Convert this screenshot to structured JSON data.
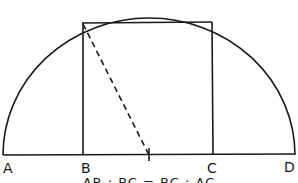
{
  "diagram": {
    "labels": {
      "A": "A",
      "B": "B",
      "C": "C",
      "D": "D"
    },
    "formula": "AB : BC = BC : AC",
    "colors": {
      "stroke": "#1a1a1a",
      "background": "#ffffff"
    },
    "geometry": {
      "baseline": {
        "x1": 3,
        "y1": 155,
        "x2": 294,
        "y2": 154
      },
      "semicircle": {
        "cx": 149,
        "cy": 155,
        "rx": 146,
        "ry": 137
      },
      "square": {
        "left": 83,
        "right": 212,
        "top": 22,
        "bottom": 155
      },
      "center_tick": {
        "x": 149,
        "y1": 148,
        "y2": 161
      },
      "dashed_line": {
        "x1": 82,
        "y1": 23,
        "x2": 149,
        "y2": 155
      }
    }
  }
}
